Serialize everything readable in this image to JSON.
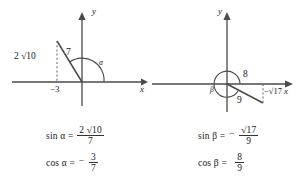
{
  "figure": {
    "background_color": "#ffffff",
    "line_color": "#3a3a3a",
    "text_color": "#222222"
  },
  "left_diagram": {
    "name": "angle-alpha-diagram",
    "axis_x_label": "x",
    "axis_y_label": "y",
    "angle_label": "α",
    "leg_vertical_label": "2 √10",
    "leg_vertical_value": "2√10",
    "hypotenuse_label": "7",
    "x_intercept_label": "−3",
    "terminal_point": {
      "x": -3,
      "y": 6.324
    },
    "quadrant": 2
  },
  "right_diagram": {
    "name": "angle-beta-diagram",
    "axis_x_label": "x",
    "axis_y_label": "y",
    "angle_label": "β",
    "adjacent_label": "8",
    "hypotenuse_label": "9",
    "leg_vertical_label": "−√17",
    "terminal_point": {
      "x": 8,
      "y": -4.123
    },
    "quadrant": 4,
    "arc_type": "reflex"
  },
  "formulas_left": [
    {
      "name": "sin-alpha",
      "lhs": "sin α =",
      "sign": "",
      "numerator": "2 √10",
      "numerator_coef": "2",
      "numerator_radicand": "10",
      "denominator": "7"
    },
    {
      "name": "cos-alpha",
      "lhs": "cos α =",
      "sign": "−",
      "numerator": "3",
      "denominator": "7"
    }
  ],
  "formulas_right": [
    {
      "name": "sin-beta",
      "lhs": "sin β =",
      "sign": "−",
      "numerator": "√17",
      "numerator_radicand": "17",
      "denominator": "9"
    },
    {
      "name": "cos-beta",
      "lhs": "cos β =",
      "sign": "",
      "numerator": "8",
      "denominator": "9"
    }
  ]
}
